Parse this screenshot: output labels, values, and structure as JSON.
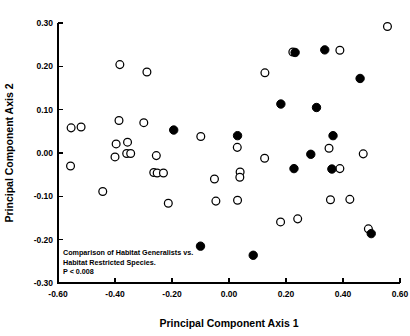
{
  "figure": {
    "background_color": "#ffffff",
    "foreground_color": "#000000"
  },
  "annotation": {
    "line1": "Comparison of Habitat Generalists vs.",
    "line2": "Habitat Restricted Species.",
    "line3": "P < 0.008"
  },
  "chart_data": {
    "type": "scatter",
    "title": "",
    "xlabel": "Principal Component Axis 1",
    "ylabel": "Principal Component Axis 2",
    "xlim": [
      -0.6,
      0.6
    ],
    "ylim": [
      -0.3,
      0.3
    ],
    "xticks": [
      -0.6,
      -0.4,
      -0.2,
      0.0,
      0.2,
      0.4,
      0.6
    ],
    "xticklabels": [
      "-0.60",
      "-0.40",
      "-0.20",
      "0.00",
      "0.20",
      "0.40",
      "0.60"
    ],
    "yticks": [
      -0.3,
      -0.2,
      -0.1,
      0.0,
      0.1,
      0.2,
      0.3
    ],
    "yticklabels": [
      "-0.30",
      "-0.20",
      "-0.10",
      "0.00",
      "0.10",
      "0.20",
      "0.30"
    ],
    "grid": false,
    "legend": "none",
    "annotations": [
      "Comparison of Habitat Generalists vs.",
      "Habitat Restricted Species.",
      "P < 0.008"
    ],
    "series": [
      {
        "name": "Habitat Generalists",
        "marker": "open-circle",
        "marker_fill": "#ffffff",
        "marker_edge": "#000000",
        "points": [
          [
            -0.554,
            0.058
          ],
          [
            -0.519,
            0.06
          ],
          [
            -0.556,
            -0.03
          ],
          [
            -0.443,
            -0.089
          ],
          [
            -0.383,
            0.204
          ],
          [
            -0.386,
            0.075
          ],
          [
            -0.396,
            0.021
          ],
          [
            -0.356,
            0.025
          ],
          [
            -0.4,
            -0.009
          ],
          [
            -0.359,
            -0.001
          ],
          [
            -0.345,
            -0.001
          ],
          [
            -0.288,
            0.187
          ],
          [
            -0.299,
            0.07
          ],
          [
            -0.255,
            -0.006
          ],
          [
            -0.264,
            -0.045
          ],
          [
            -0.252,
            -0.046
          ],
          [
            -0.23,
            -0.046
          ],
          [
            -0.213,
            -0.116
          ],
          [
            -0.099,
            0.038
          ],
          [
            -0.051,
            -0.06
          ],
          [
            -0.046,
            -0.111
          ],
          [
            0.029,
            0.013
          ],
          [
            0.03,
            -0.109
          ],
          [
            0.039,
            -0.044
          ],
          [
            0.038,
            -0.056
          ],
          [
            0.126,
            0.185
          ],
          [
            0.125,
            -0.012
          ],
          [
            0.181,
            -0.159
          ],
          [
            0.224,
            0.233
          ],
          [
            0.241,
            -0.152
          ],
          [
            0.351,
            0.011
          ],
          [
            0.356,
            -0.108
          ],
          [
            0.389,
            0.237
          ],
          [
            0.389,
            -0.036
          ],
          [
            0.424,
            -0.107
          ],
          [
            0.471,
            -0.002
          ],
          [
            0.489,
            -0.175
          ],
          [
            0.556,
            0.292
          ]
        ]
      },
      {
        "name": "Habitat Restricted Species",
        "marker": "filled-circle",
        "marker_fill": "#000000",
        "marker_edge": "#000000",
        "points": [
          [
            -0.194,
            0.053
          ],
          [
            -0.1,
            -0.215
          ],
          [
            0.03,
            0.04
          ],
          [
            0.085,
            -0.236
          ],
          [
            0.182,
            0.113
          ],
          [
            0.228,
            -0.036
          ],
          [
            0.232,
            0.232
          ],
          [
            0.287,
            -0.003
          ],
          [
            0.307,
            0.105
          ],
          [
            0.336,
            0.238
          ],
          [
            0.361,
            -0.037
          ],
          [
            0.365,
            0.04
          ],
          [
            0.46,
            0.172
          ],
          [
            0.499,
            -0.186
          ]
        ]
      }
    ]
  }
}
